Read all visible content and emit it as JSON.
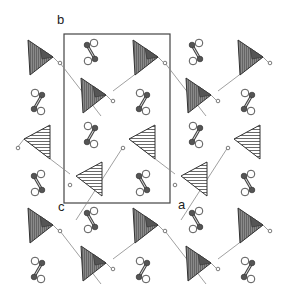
{
  "figure": {
    "type": "crystal-structure-projection",
    "axis_labels": {
      "b": "b",
      "c": "c",
      "a": "a"
    },
    "unit_cell": {
      "x": 64,
      "y": 34,
      "width": 106,
      "height": 169
    },
    "colors": {
      "stroke": "#333333",
      "shade_dark": "#555555",
      "shade_mid": "#8a8a8a",
      "link": "#888888",
      "atom_dark": "#555555"
    },
    "tetrahedra_shaded": [
      {
        "x": 28,
        "y": 40
      },
      {
        "x": 133,
        "y": 40
      },
      {
        "x": 238,
        "y": 40
      },
      {
        "x": 81,
        "y": 78
      },
      {
        "x": 186,
        "y": 78
      },
      {
        "x": 28,
        "y": 208
      },
      {
        "x": 133,
        "y": 208
      },
      {
        "x": 238,
        "y": 208
      },
      {
        "x": 81,
        "y": 246
      },
      {
        "x": 186,
        "y": 246
      }
    ],
    "triangles_hatched": [
      {
        "x": 24,
        "y": 125
      },
      {
        "x": 129,
        "y": 125
      },
      {
        "x": 234,
        "y": 125
      },
      {
        "x": 76,
        "y": 162
      },
      {
        "x": 181,
        "y": 162
      }
    ],
    "dumbbells": [
      {
        "x": 91,
        "y": 52,
        "flip": false
      },
      {
        "x": 196,
        "y": 52,
        "flip": false
      },
      {
        "x": 38,
        "y": 102,
        "flip": true
      },
      {
        "x": 143,
        "y": 102,
        "flip": true
      },
      {
        "x": 248,
        "y": 102,
        "flip": true
      },
      {
        "x": 91,
        "y": 135,
        "flip": true
      },
      {
        "x": 196,
        "y": 135,
        "flip": true
      },
      {
        "x": 38,
        "y": 183,
        "flip": false
      },
      {
        "x": 143,
        "y": 183,
        "flip": false
      },
      {
        "x": 248,
        "y": 183,
        "flip": false
      },
      {
        "x": 91,
        "y": 220,
        "flip": false
      },
      {
        "x": 196,
        "y": 220,
        "flip": false
      },
      {
        "x": 38,
        "y": 270,
        "flip": true
      },
      {
        "x": 143,
        "y": 270,
        "flip": true
      },
      {
        "x": 248,
        "y": 270,
        "flip": true
      }
    ]
  }
}
